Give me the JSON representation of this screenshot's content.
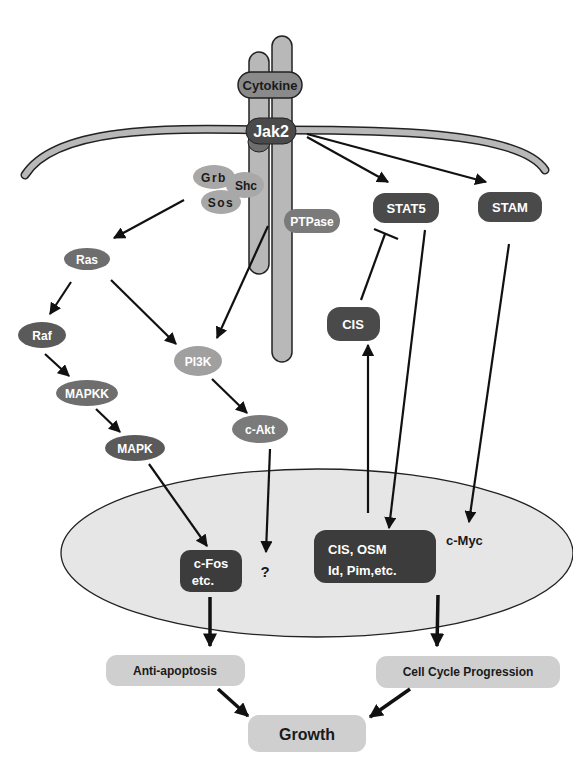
{
  "colors": {
    "dark_node": "#4a4a4a",
    "mid_node": "#6e6e6e",
    "light_node": "#9c9c9c",
    "membrane": "#b8b8b8",
    "nucleus": "#e6e6e6",
    "outcome": "#cfcfcf"
  },
  "nodes": {
    "cytokine": "Cytokine",
    "jak2": "Jak2",
    "grb": "Grb",
    "shc": "Shc",
    "sos": "Sos",
    "ptpase": "PTPase",
    "stat5": "STAT5",
    "stam": "STAM",
    "ras": "Ras",
    "raf": "Raf",
    "mapkk": "MAPKK",
    "mapk": "MAPK",
    "pi3k": "PI3K",
    "cakt": "c-Akt",
    "cis": "CIS",
    "cfos_line1": "c-Fos",
    "cfos_line2": "etc.",
    "unknown": "?",
    "targets_line1": "CIS, OSM",
    "targets_line2": "Id, Pim,etc.",
    "cmyc": "c-Myc"
  },
  "outcomes": {
    "anti_apoptosis": "Anti-apoptosis",
    "cell_cycle": "Cell Cycle Progression",
    "growth": "Growth"
  },
  "edges": [
    {
      "from": "jak2",
      "to": "stat5",
      "type": "activation"
    },
    {
      "from": "jak2",
      "to": "stam",
      "type": "activation"
    },
    {
      "from": "grb-shc-sos",
      "to": "ras",
      "type": "activation"
    },
    {
      "from": "ptpase",
      "to": "pi3k",
      "type": "activation"
    },
    {
      "from": "ras",
      "to": "raf",
      "type": "activation"
    },
    {
      "from": "ras",
      "to": "pi3k",
      "type": "activation"
    },
    {
      "from": "raf",
      "to": "mapkk",
      "type": "activation"
    },
    {
      "from": "mapkk",
      "to": "mapk",
      "type": "activation"
    },
    {
      "from": "pi3k",
      "to": "cakt",
      "type": "activation"
    },
    {
      "from": "mapk",
      "to": "cfos",
      "type": "activation"
    },
    {
      "from": "cakt",
      "to": "unknown",
      "type": "activation"
    },
    {
      "from": "cis",
      "to": "stat5",
      "type": "inhibition"
    },
    {
      "from": "stat5",
      "to": "targets",
      "type": "activation"
    },
    {
      "from": "targets",
      "to": "cis",
      "type": "activation"
    },
    {
      "from": "stam",
      "to": "cmyc",
      "type": "activation"
    },
    {
      "from": "cfos",
      "to": "anti_apoptosis",
      "type": "activation"
    },
    {
      "from": "targets",
      "to": "cell_cycle",
      "type": "activation"
    },
    {
      "from": "anti_apoptosis",
      "to": "growth",
      "type": "activation"
    },
    {
      "from": "cell_cycle",
      "to": "growth",
      "type": "activation"
    }
  ]
}
